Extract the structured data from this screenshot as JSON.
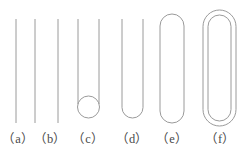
{
  "figure": {
    "caption_labels": [
      {
        "key": "a",
        "text": "（a）"
      },
      {
        "key": "b",
        "text": "（b）"
      },
      {
        "key": "c",
        "text": "（c）"
      },
      {
        "key": "d",
        "text": "（d）"
      },
      {
        "key": "e",
        "text": "（e）"
      },
      {
        "key": "f",
        "text": "（f）"
      }
    ],
    "stroke_color": "#9a9a9a",
    "background_color": "#ffffff",
    "label_color": "#4a4a4a",
    "shapes": [
      {
        "key": "a",
        "name": "single-vertical-line",
        "type": "line",
        "x1": 16,
        "y1": 19,
        "x2": 16,
        "y2": 123
      },
      {
        "key": "b",
        "name": "single-vertical-line",
        "type": "line",
        "x1": 35,
        "y1": 19,
        "x2": 35,
        "y2": 123
      },
      {
        "key": "b2",
        "name": "single-vertical-line",
        "type": "line",
        "x1": 58,
        "y1": 19,
        "x2": 58,
        "y2": 123
      },
      {
        "key": "c",
        "name": "two-lines-with-circle-loop",
        "type": "lines-circle",
        "left_x": 78,
        "right_x": 99,
        "top_y": 19,
        "bottom_y": 118,
        "circle_cx": 88.5,
        "circle_cy": 107,
        "circle_r": 11
      },
      {
        "key": "d",
        "name": "open-hairpin-u-shape",
        "type": "u-shape",
        "left_x": 122,
        "right_x": 143,
        "top_y": 19,
        "bottom_y": 118,
        "radius": 10.5
      },
      {
        "key": "e",
        "name": "closed-stadium-capsule",
        "type": "stadium",
        "left_x": 160,
        "right_x": 184,
        "top_y": 14,
        "bottom_y": 123,
        "radius": 12
      },
      {
        "key": "f",
        "name": "nested-double-stadium",
        "type": "stadium-nested",
        "outer_left_x": 203,
        "outer_right_x": 236,
        "outer_top_y": 10,
        "outer_bottom_y": 126,
        "outer_radius": 16.5,
        "inner_left_x": 208,
        "inner_right_x": 231,
        "inner_top_y": 15,
        "inner_bottom_y": 121,
        "inner_radius": 11.5
      }
    ]
  }
}
